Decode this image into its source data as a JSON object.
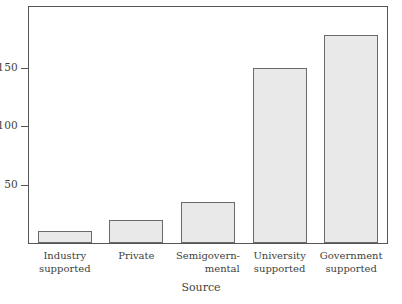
{
  "chart_data": {
    "type": "bar",
    "title": "",
    "xlabel": "Source",
    "ylabel": "",
    "categories": [
      "Industry supported",
      "Private",
      "Semigovernmental",
      "University supported",
      "Government supported"
    ],
    "category_lines": [
      [
        "Industry",
        "supported"
      ],
      [
        "Private",
        ""
      ],
      [
        "Semigovern-",
        "mental"
      ],
      [
        "University",
        "supported"
      ],
      [
        "Government",
        "supported"
      ]
    ],
    "values": [
      10,
      20,
      35,
      150,
      178
    ],
    "ylim": [
      0,
      202
    ],
    "yticks": [
      50,
      100,
      150
    ],
    "ytick_labels": [
      "50",
      "100",
      "150"
    ],
    "grid": false,
    "legend": false,
    "bar_fill_color": "#e9e9e9",
    "bar_edge_color": "#6a6a6e",
    "frame_color": "#555558",
    "background_color": "#ffffff"
  }
}
